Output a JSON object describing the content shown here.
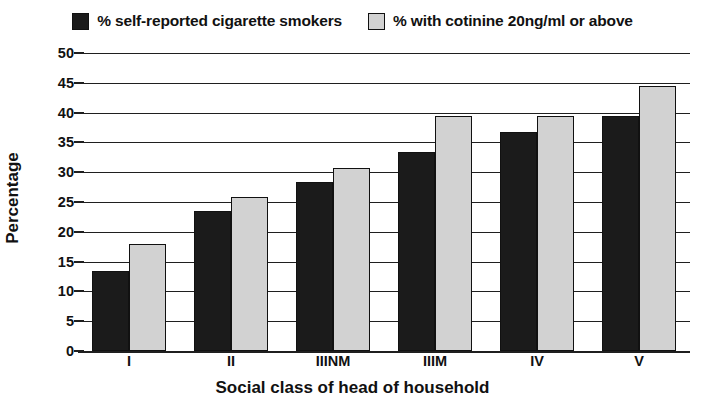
{
  "chart_data": {
    "type": "bar",
    "title": "",
    "xlabel": "Social class of head of household",
    "ylabel": "Percentage",
    "categories": [
      "I",
      "II",
      "IIINM",
      "IIIM",
      "IV",
      "V"
    ],
    "series": [
      {
        "name": "% self-reported cigarette smokers",
        "color": "#1b1b1b",
        "values": [
          13.5,
          23.5,
          28.4,
          33.4,
          36.7,
          39.4
        ]
      },
      {
        "name": "% with cotinine 20ng/ml or above",
        "color": "#d2d2d2",
        "values": [
          18.0,
          25.9,
          30.7,
          39.5,
          39.5,
          44.4
        ]
      }
    ],
    "ylim": [
      0,
      50
    ],
    "ytick_step": 5,
    "yticks": [
      "50",
      "45",
      "40",
      "35",
      "30",
      "25",
      "20",
      "15",
      "10",
      "5",
      "0"
    ],
    "grid": true,
    "legend_position": "top"
  },
  "legend": {
    "items": [
      {
        "label": "% self-reported cigarette smokers",
        "swatch": "dark"
      },
      {
        "label": "% with cotinine 20ng/ml or above",
        "swatch": "light"
      }
    ]
  }
}
